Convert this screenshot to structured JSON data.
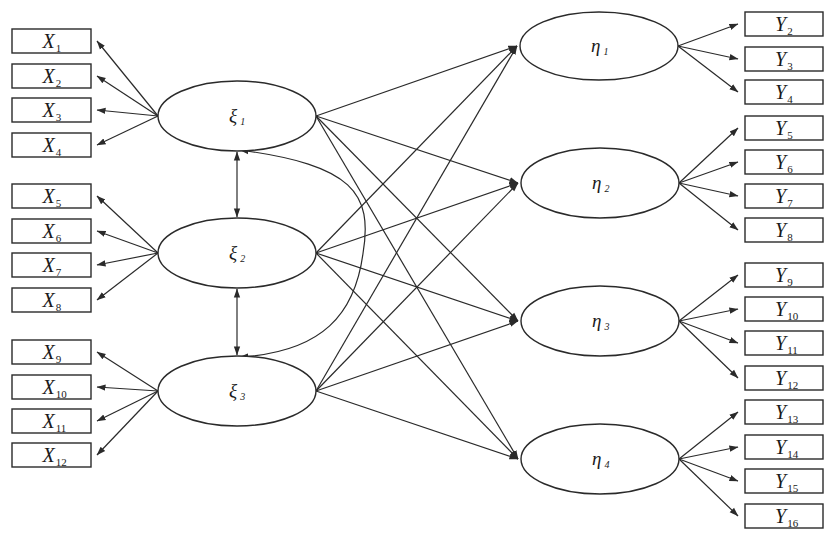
{
  "diagram": {
    "type": "structural-equation-model",
    "colors": {
      "stroke": "#2a2a2a",
      "text": "#1a1a1a",
      "background": "#ffffff"
    },
    "exogenous_latents": [
      {
        "id": "xi1",
        "symbol": "ξ",
        "sub": "1",
        "cx": 237,
        "cy": 116,
        "rx": 79,
        "ry": 35
      },
      {
        "id": "xi2",
        "symbol": "ξ",
        "sub": "2",
        "cx": 237,
        "cy": 253,
        "rx": 79,
        "ry": 35
      },
      {
        "id": "xi3",
        "symbol": "ξ",
        "sub": "3",
        "cx": 237,
        "cy": 391,
        "rx": 79,
        "ry": 35
      }
    ],
    "endogenous_latents": [
      {
        "id": "eta1",
        "symbol": "η",
        "sub": "1",
        "cx": 599,
        "cy": 46,
        "rx": 79,
        "ry": 34
      },
      {
        "id": "eta2",
        "symbol": "η",
        "sub": "2",
        "cx": 600,
        "cy": 183,
        "rx": 79,
        "ry": 35
      },
      {
        "id": "eta3",
        "symbol": "η",
        "sub": "3",
        "cx": 600,
        "cy": 321,
        "rx": 79,
        "ry": 35
      },
      {
        "id": "eta4",
        "symbol": "η",
        "sub": "4",
        "cx": 600,
        "cy": 459,
        "rx": 79,
        "ry": 35
      }
    ],
    "x_indicators": [
      {
        "symbol": "X",
        "sub": "1",
        "y": 29,
        "latent": "xi1"
      },
      {
        "symbol": "X",
        "sub": "2",
        "y": 64,
        "latent": "xi1"
      },
      {
        "symbol": "X",
        "sub": "3",
        "y": 98,
        "latent": "xi1"
      },
      {
        "symbol": "X",
        "sub": "4",
        "y": 133,
        "latent": "xi1"
      },
      {
        "symbol": "X",
        "sub": "5",
        "y": 184,
        "latent": "xi2"
      },
      {
        "symbol": "X",
        "sub": "6",
        "y": 219,
        "latent": "xi2"
      },
      {
        "symbol": "X",
        "sub": "7",
        "y": 253,
        "latent": "xi2"
      },
      {
        "symbol": "X",
        "sub": "8",
        "y": 288,
        "latent": "xi2"
      },
      {
        "symbol": "X",
        "sub": "9",
        "y": 340,
        "latent": "xi3"
      },
      {
        "symbol": "X",
        "sub": "10",
        "y": 375,
        "latent": "xi3"
      },
      {
        "symbol": "X",
        "sub": "11",
        "y": 409,
        "latent": "xi3"
      },
      {
        "symbol": "X",
        "sub": "12",
        "y": 443,
        "latent": "xi3"
      }
    ],
    "y_indicators": [
      {
        "symbol": "Y",
        "sub": "2",
        "y": 12,
        "latent": "eta1"
      },
      {
        "symbol": "Y",
        "sub": "3",
        "y": 47,
        "latent": "eta1"
      },
      {
        "symbol": "Y",
        "sub": "4",
        "y": 80,
        "latent": "eta1"
      },
      {
        "symbol": "Y",
        "sub": "5",
        "y": 116,
        "latent": "eta2"
      },
      {
        "symbol": "Y",
        "sub": "6",
        "y": 150,
        "latent": "eta2"
      },
      {
        "symbol": "Y",
        "sub": "7",
        "y": 184,
        "latent": "eta2"
      },
      {
        "symbol": "Y",
        "sub": "8",
        "y": 218,
        "latent": "eta2"
      },
      {
        "symbol": "Y",
        "sub": "9",
        "y": 263,
        "latent": "eta3"
      },
      {
        "symbol": "Y",
        "sub": "10",
        "y": 297,
        "latent": "eta3"
      },
      {
        "symbol": "Y",
        "sub": "11",
        "y": 331,
        "latent": "eta3"
      },
      {
        "symbol": "Y",
        "sub": "12",
        "y": 366,
        "latent": "eta3"
      },
      {
        "symbol": "Y",
        "sub": "13",
        "y": 400,
        "latent": "eta4"
      },
      {
        "symbol": "Y",
        "sub": "14",
        "y": 435,
        "latent": "eta4"
      },
      {
        "symbol": "Y",
        "sub": "15",
        "y": 469,
        "latent": "eta4"
      },
      {
        "symbol": "Y",
        "sub": "16",
        "y": 504,
        "latent": "eta4"
      }
    ],
    "box_geometry": {
      "x_left": 12,
      "x_right": 91,
      "y_left": 745,
      "y_right": 823,
      "height": 24
    },
    "structural_paths": [
      {
        "from": "xi1",
        "to": "eta1"
      },
      {
        "from": "xi1",
        "to": "eta2"
      },
      {
        "from": "xi1",
        "to": "eta3"
      },
      {
        "from": "xi1",
        "to": "eta4"
      },
      {
        "from": "xi2",
        "to": "eta1"
      },
      {
        "from": "xi2",
        "to": "eta2"
      },
      {
        "from": "xi2",
        "to": "eta3"
      },
      {
        "from": "xi2",
        "to": "eta4"
      },
      {
        "from": "xi3",
        "to": "eta1"
      },
      {
        "from": "xi3",
        "to": "eta2"
      },
      {
        "from": "xi3",
        "to": "eta3"
      },
      {
        "from": "xi3",
        "to": "eta4"
      }
    ],
    "covariances": [
      {
        "from": "xi1",
        "to": "xi2",
        "shape": "straight"
      },
      {
        "from": "xi2",
        "to": "xi3",
        "shape": "straight"
      },
      {
        "from": "xi1",
        "to": "xi3",
        "shape": "arc",
        "bulge_x": 363
      }
    ]
  }
}
